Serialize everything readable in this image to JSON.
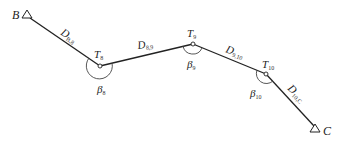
{
  "diagram": {
    "type": "traverse-survey",
    "points": {
      "B": {
        "label": "B",
        "x": 28,
        "y": 15,
        "symbol": "triangle"
      },
      "T8": {
        "label": "T",
        "sub": "8",
        "x": 100,
        "y": 66,
        "symbol": "circle"
      },
      "T9": {
        "label": "T",
        "sub": "9",
        "x": 193,
        "y": 44,
        "symbol": "circle"
      },
      "T10": {
        "label": "T",
        "sub": "10",
        "x": 266,
        "y": 74,
        "symbol": "circle"
      },
      "C": {
        "label": "C",
        "x": 315,
        "y": 128,
        "symbol": "triangle"
      }
    },
    "distances": [
      {
        "label": "D",
        "sub": "B,8",
        "from": "B",
        "to": "T8"
      },
      {
        "label": "D",
        "sub": "8,9",
        "from": "T8",
        "to": "T9"
      },
      {
        "label": "D",
        "sub": "9,10",
        "from": "T9",
        "to": "T10"
      },
      {
        "label": "D",
        "sub": "10,C",
        "from": "T10",
        "to": "C"
      }
    ],
    "angles": [
      {
        "label": "β",
        "sub": "8",
        "at": "T8"
      },
      {
        "label": "β",
        "sub": "9",
        "at": "T9"
      },
      {
        "label": "β",
        "sub": "10",
        "at": "T10"
      }
    ],
    "colors": {
      "line": "#222222",
      "text": "#222222"
    }
  }
}
